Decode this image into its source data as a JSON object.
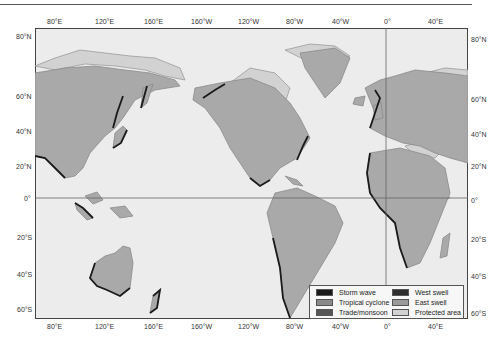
{
  "map": {
    "projection": "Mercator, Pacific-centered",
    "colors": {
      "ocean": "#ececec",
      "land": "#a9a9a9",
      "storm_wave": "#1a1a1a",
      "tropical_cyclone": "#8a8a8a",
      "trade_monsoon": "#555555",
      "west_swell": "#2e2e2e",
      "east_swell": "#9a9a9a",
      "protected_area": "#d2d2d2"
    },
    "top_axis": [
      "80°E",
      "120°E",
      "160°E",
      "160°W",
      "120°W",
      "80°W",
      "40°W",
      "0°",
      "40°E"
    ],
    "bottom_axis": [
      "80°E",
      "120°E",
      "160°E",
      "160°W",
      "120°W",
      "80°W",
      "40°W",
      "0°",
      "40°E"
    ],
    "left_axis": [
      "80°N",
      "60°N",
      "40°N",
      "20°N",
      "0°",
      "20°S",
      "40°S",
      "60°S"
    ],
    "right_axis": [
      "80°N",
      "60°N",
      "40°N",
      "20°N",
      "0°",
      "20°S",
      "40°S",
      "60°S"
    ]
  },
  "legend": {
    "items": [
      {
        "label": "Storm wave",
        "color": "#1a1a1a"
      },
      {
        "label": "Tropical cyclone",
        "color": "#8a8a8a"
      },
      {
        "label": "Trade/monsoon",
        "color": "#555555"
      },
      {
        "label": "West swell",
        "color": "#2e2e2e"
      },
      {
        "label": "East swell",
        "color": "#9a9a9a"
      },
      {
        "label": "Protected area",
        "color": "#d2d2d2"
      }
    ]
  }
}
